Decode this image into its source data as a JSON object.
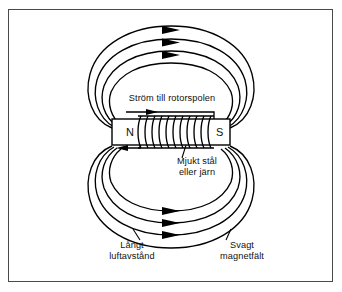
{
  "figure": {
    "language": "sv",
    "frame_color": "#4a4a4a",
    "line_color": "#000000",
    "background": "#ffffff"
  },
  "core": {
    "pole_left": "N",
    "pole_right": "S",
    "material_label": "Mjukt stål\neller järn",
    "coil_turns": 11
  },
  "labels": {
    "current": "Ström till rotorspolen",
    "material": "Mjukt stål\neller järn",
    "air_gap": "Långt\nluftavstånd",
    "field_strength": "Svagt\nmagnetfält"
  },
  "field": {
    "loops_above": 4,
    "loops_below": 4,
    "arrows_above": 3,
    "arrows_below": 3,
    "direction": "N till S via luft, pilar pekar åt höger"
  }
}
